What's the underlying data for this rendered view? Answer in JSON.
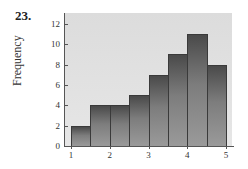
{
  "problem": {
    "number": "23."
  },
  "chart_data": {
    "type": "bar",
    "subtype": "histogram",
    "title": "",
    "xlabel": "",
    "ylabel": "Frequency",
    "bin_edges": [
      1,
      1.5,
      2,
      2.5,
      3,
      3.5,
      4,
      4.5,
      5
    ],
    "categories": [
      "1–1.5",
      "1.5–2",
      "2–2.5",
      "2.5–3",
      "3–3.5",
      "3.5–4",
      "4–4.5",
      "4.5–5"
    ],
    "values": [
      2,
      4,
      4,
      5,
      7,
      9,
      11,
      8
    ],
    "xlim": [
      1,
      5
    ],
    "ylim": [
      0,
      13
    ],
    "xticks": [
      "1",
      "2",
      "3",
      "4",
      "5"
    ],
    "yticks": [
      "0",
      "2",
      "4",
      "6",
      "8",
      "10",
      "12"
    ],
    "grid": false,
    "legend": null,
    "colors": {
      "plot_background": "#e0e0e0",
      "bar_fill_top": "#4a4a4a",
      "bar_fill_bottom": "#9a9a9a",
      "bar_edge": "#3a3a3a"
    }
  }
}
